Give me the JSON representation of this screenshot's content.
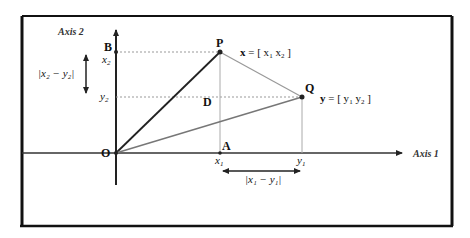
{
  "diagram": {
    "frame": {
      "stroke": "#111111"
    },
    "axes": {
      "axis1_label": "Axis 1",
      "axis2_label": "Axis 2"
    },
    "points": {
      "origin": "O",
      "P": "P",
      "Q": "Q",
      "A": "A",
      "B": "B",
      "D": "D"
    },
    "vector_labels": {
      "x_prefix": "x",
      "x_eq": " = [ x",
      "x_sub1": "1",
      "x_mid": "  x",
      "x_sub2": "2",
      "x_end": " ]",
      "y_prefix": "y",
      "y_eq": " = [ y",
      "y_sub1": "1",
      "y_mid": "  y",
      "y_sub2": "2",
      "y_end": " ]"
    },
    "tick_labels": {
      "x2": "x",
      "x2_sub": "2",
      "y2": "y",
      "y2_sub": "2",
      "x1": "x",
      "x1_sub": "1",
      "y1": "y",
      "y1_sub": "1"
    },
    "distance_labels": {
      "vertical": "|x₂ − y₂|",
      "horizontal": "|x₁ − y₁|"
    },
    "colors": {
      "dark_line": "#222222",
      "gray_line": "#888888",
      "dotted_line": "#999999"
    }
  }
}
